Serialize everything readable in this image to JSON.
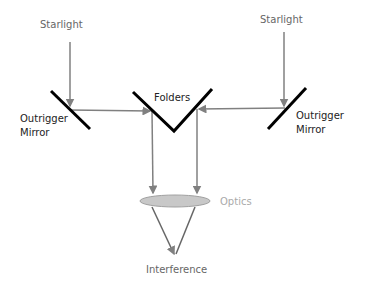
{
  "diagram": {
    "labels": {
      "starlight_left": "Starlight",
      "starlight_right": "Starlight",
      "outrigger_left_line1": "Outrigger",
      "outrigger_left_line2": "Mirror",
      "outrigger_right_line1": "Outrigger",
      "outrigger_right_line2": "Mirror",
      "folders": "Folders",
      "optics": "Optics",
      "interference": "Interference"
    },
    "colors": {
      "beam": "#808080",
      "mirror": "#000000",
      "optics_fill": "#c8c8c8",
      "optics_label": "#aaaaaa",
      "text": "#666666",
      "text_dark": "#222222"
    }
  }
}
